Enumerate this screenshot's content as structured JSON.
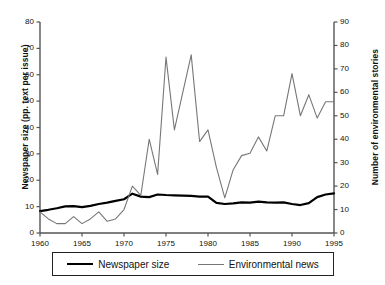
{
  "chart_data": {
    "type": "line",
    "title": "",
    "xlabel": "",
    "x": [
      1960,
      1961,
      1962,
      1963,
      1964,
      1965,
      1966,
      1967,
      1968,
      1969,
      1970,
      1971,
      1972,
      1973,
      1974,
      1975,
      1976,
      1977,
      1978,
      1979,
      1980,
      1981,
      1982,
      1983,
      1984,
      1985,
      1986,
      1987,
      1988,
      1989,
      1990,
      1991,
      1992,
      1993,
      1994,
      1995
    ],
    "xlim": [
      1960,
      1995
    ],
    "xticks": [
      1960,
      1965,
      1970,
      1975,
      1980,
      1985,
      1990,
      1995
    ],
    "xtick_labels": [
      "1960",
      "1965",
      "1970",
      "1975",
      "1980",
      "1985",
      "1990",
      "1995"
    ],
    "grid": false,
    "legend_position": "below-axes",
    "axes": [
      {
        "id": "left",
        "label": "Newspaper size (pp. text per issue)",
        "lim": [
          0,
          80
        ],
        "ticks": [
          0,
          10,
          20,
          30,
          40,
          50,
          60,
          70,
          80
        ],
        "tick_labels": [
          "0",
          "10",
          "20",
          "30",
          "40",
          "50",
          "60",
          "70",
          "80"
        ]
      },
      {
        "id": "right",
        "label": "Number of environmental stories",
        "lim": [
          0,
          90
        ],
        "ticks": [
          0,
          10,
          20,
          30,
          40,
          50,
          60,
          70,
          80,
          90
        ],
        "tick_labels": [
          "0",
          "10",
          "20",
          "30",
          "40",
          "50",
          "60",
          "70",
          "80",
          "90"
        ]
      }
    ],
    "series": [
      {
        "name": "Newspaper size",
        "axis": "left",
        "units": "pp. text per issue",
        "color": "#000000",
        "line_width": 2.2,
        "values": [
          8.3,
          8.8,
          9.4,
          10.1,
          10.2,
          9.8,
          10.3,
          11.0,
          11.5,
          12.2,
          12.8,
          14.9,
          13.8,
          13.6,
          14.6,
          14.4,
          14.3,
          14.2,
          14.1,
          13.8,
          13.8,
          11.4,
          11.0,
          11.2,
          11.6,
          11.5,
          11.9,
          11.6,
          11.5,
          11.6,
          11.0,
          10.6,
          11.3,
          13.6,
          14.6,
          15.0
        ]
      },
      {
        "name": "Environmental news",
        "axis": "right",
        "units": "stories",
        "color": "#777777",
        "line_width": 1.1,
        "values": [
          9,
          6,
          4,
          4,
          7,
          4,
          6,
          9,
          5,
          6,
          10,
          20,
          16,
          40,
          25,
          75,
          44,
          60,
          76,
          39,
          44,
          28,
          15,
          27,
          33,
          34,
          41,
          35,
          50,
          50,
          68,
          50,
          59,
          49,
          56,
          56
        ]
      }
    ]
  },
  "legend": {
    "items": [
      {
        "label": "Newspaper size",
        "swatch": "thick-black-line"
      },
      {
        "label": "Environmental news",
        "swatch": "thin-gray-line"
      }
    ]
  },
  "colors": {
    "newspaper_size": "#000000",
    "environmental_news": "#777777",
    "axis": "#555555",
    "text": "#111111"
  }
}
